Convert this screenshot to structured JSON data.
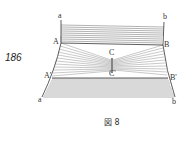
{
  "page_number": "186",
  "figure": {
    "caption": "図 8",
    "labels": {
      "a_top": "a",
      "b_top": "b",
      "A": "A",
      "B": "B",
      "C": "C",
      "C_prime": "C'",
      "A_prime": "A'",
      "B_prime": "B'",
      "a_bottom": "a",
      "b_bottom": "b"
    },
    "line_color": "#555555"
  }
}
